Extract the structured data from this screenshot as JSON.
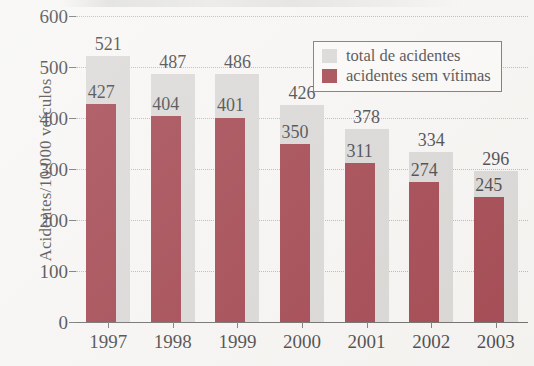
{
  "chart_data": {
    "type": "bar",
    "title": "",
    "subtitle": "",
    "xlabel": "",
    "ylabel": "Acidentes/10.000 veículos",
    "categories": [
      "1997",
      "1998",
      "1999",
      "2000",
      "2001",
      "2002",
      "2003"
    ],
    "series": [
      {
        "name": "total de acidentes",
        "color": "#d2d0ce",
        "values": [
          521,
          487,
          486,
          426,
          378,
          334,
          296
        ]
      },
      {
        "name": "acidentes sem vítimas",
        "color": "#8c1724",
        "values": [
          427,
          404,
          401,
          350,
          311,
          274,
          245
        ]
      }
    ],
    "ylim": [
      0,
      600
    ],
    "ytick_values": [
      0,
      100,
      200,
      300,
      400,
      500,
      600
    ],
    "ytick_labels": [
      "0",
      "100",
      "200",
      "300",
      "400",
      "500",
      "600"
    ],
    "grid": true,
    "grid_style": "dotted-horizontal",
    "legend_position": "top-right",
    "data_labels": true,
    "background_color": "#f6f5f3",
    "axis_color": "#4a4a4a",
    "text_color": "#17171a"
  },
  "legend": {
    "items": [
      {
        "label": "total de acidentes",
        "swatch": "total"
      },
      {
        "label": "acidentes sem vítimas",
        "swatch": "novictim"
      }
    ]
  },
  "axes": {
    "y_title": "Acidentes/10.000 veículos",
    "y_ticks": [
      "600",
      "500",
      "400",
      "300",
      "200",
      "100",
      "0"
    ],
    "x_ticks": [
      "1997",
      "1998",
      "1999",
      "2000",
      "2001",
      "2002",
      "2003"
    ]
  }
}
